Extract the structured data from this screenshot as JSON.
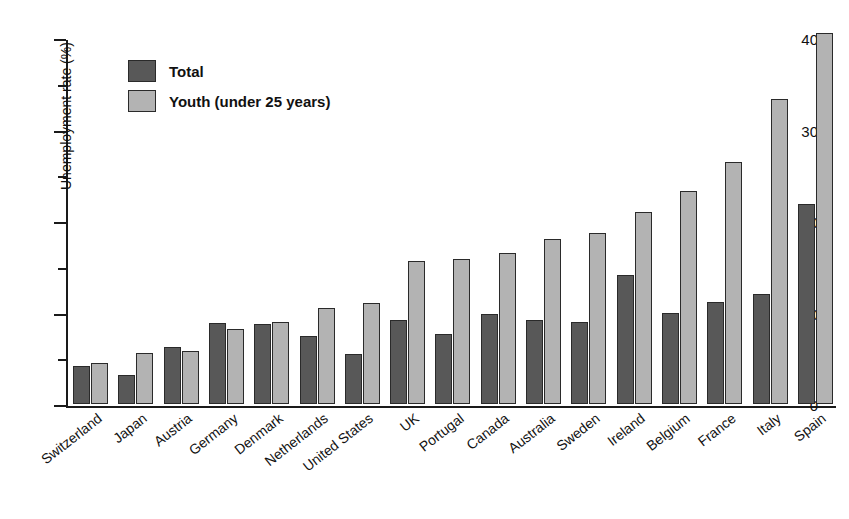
{
  "chart_data": {
    "type": "bar",
    "title": "",
    "title_sliver": "(cropped figure caption)",
    "xlabel": "",
    "ylabel": "Unemployment rate (%)",
    "ylim": [
      0,
      40
    ],
    "yticks": [
      0,
      10,
      20,
      30,
      40
    ],
    "ytick_labels": [
      "0",
      "10",
      "20",
      "30",
      "40"
    ],
    "yminor_ticks": [
      5,
      15,
      25,
      35
    ],
    "grid": false,
    "legend_position": "upper left",
    "categories": [
      "Switzerland",
      "Japan",
      "Austria",
      "Germany",
      "Denmark",
      "Netherlands",
      "United States",
      "UK",
      "Portugal",
      "Canada",
      "Australia",
      "Sweden",
      "Ireland",
      "Belgium",
      "France",
      "Italy",
      "Spain"
    ],
    "series": [
      {
        "name": "Total",
        "color": "#585858",
        "values": [
          4.2,
          3.2,
          6.2,
          8.9,
          8.7,
          7.4,
          5.5,
          9.2,
          7.7,
          9.8,
          9.2,
          9.0,
          14.1,
          10.0,
          11.1,
          12.0,
          21.9
        ]
      },
      {
        "name": "Youth (under 25 years)",
        "color": "#b3b3b3",
        "values": [
          4.5,
          5.6,
          5.8,
          8.2,
          9.0,
          10.5,
          11.0,
          15.6,
          15.9,
          16.5,
          18.0,
          18.7,
          21.0,
          23.3,
          26.5,
          33.3,
          40.6
        ]
      }
    ]
  },
  "legend": {
    "items": [
      {
        "label": "Total",
        "color": "#585858"
      },
      {
        "label": "Youth (under 25 years)",
        "color": "#b3b3b3"
      }
    ]
  },
  "axes": {
    "y_title": "Unemployment rate (%)"
  }
}
